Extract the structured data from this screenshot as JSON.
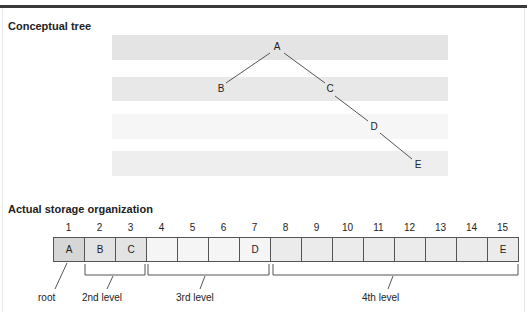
{
  "sections": {
    "tree_title": "Conceptual tree",
    "storage_title": "Actual storage organization"
  },
  "colors": {
    "level1": "#d6d6d6",
    "level2": "#e3e3e3",
    "level3": "#f5f5f5",
    "level4": "#ebebeb",
    "band1": "#e4e4e4",
    "band2": "#e8e8e8",
    "band3": "#f6f6f6",
    "band4": "#eeeeee"
  },
  "tree": {
    "nodes": [
      {
        "label": "A",
        "x": 271,
        "y": 41
      },
      {
        "label": "B",
        "x": 215,
        "y": 83
      },
      {
        "label": "C",
        "x": 324,
        "y": 83
      },
      {
        "label": "D",
        "x": 368,
        "y": 121
      },
      {
        "label": "E",
        "x": 412,
        "y": 159
      }
    ],
    "edges": [
      {
        "from": "A",
        "to": "B"
      },
      {
        "from": "A",
        "to": "C"
      },
      {
        "from": "C",
        "to": "D"
      },
      {
        "from": "D",
        "to": "E"
      }
    ]
  },
  "storage": {
    "indices": [
      "1",
      "2",
      "3",
      "4",
      "5",
      "6",
      "7",
      "8",
      "9",
      "10",
      "11",
      "12",
      "13",
      "14",
      "15"
    ],
    "cells": [
      {
        "value": "A",
        "level": 1
      },
      {
        "value": "B",
        "level": 2
      },
      {
        "value": "C",
        "level": 2
      },
      {
        "value": "",
        "level": 3
      },
      {
        "value": "",
        "level": 3
      },
      {
        "value": "",
        "level": 3
      },
      {
        "value": "D",
        "level": 3
      },
      {
        "value": "",
        "level": 4
      },
      {
        "value": "",
        "level": 4
      },
      {
        "value": "",
        "level": 4
      },
      {
        "value": "",
        "level": 4
      },
      {
        "value": "",
        "level": 4
      },
      {
        "value": "",
        "level": 4
      },
      {
        "value": "",
        "level": 4
      },
      {
        "value": "E",
        "level": 4
      }
    ],
    "labels": {
      "root": "root",
      "level2": "2nd level",
      "level3": "3rd level",
      "level4": "4th level"
    }
  }
}
